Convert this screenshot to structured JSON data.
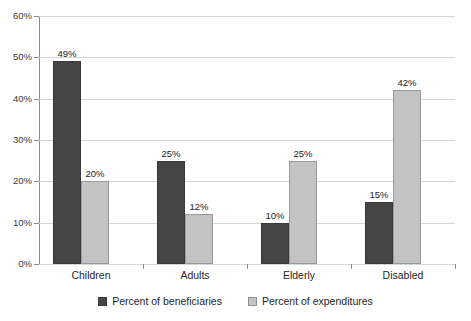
{
  "chart_data": {
    "type": "bar",
    "title": "",
    "subtitle": "",
    "xlabel": "",
    "ylabel": "",
    "categories": [
      "Children",
      "Adults",
      "Elderly",
      "Disabled"
    ],
    "series": [
      {
        "name": "Percent of beneficiaries",
        "color": "#454545",
        "values": [
          49,
          25,
          10,
          15
        ],
        "labels": [
          "49%",
          "25%",
          "10%",
          "15%"
        ]
      },
      {
        "name": "Percent of expenditures",
        "color": "#c3c3c3",
        "values": [
          20,
          12,
          25,
          42
        ],
        "labels": [
          "20%",
          "12%",
          "25%",
          "42%"
        ]
      }
    ],
    "ylim": [
      0,
      60
    ],
    "ytick_values": [
      0,
      10,
      20,
      30,
      40,
      50,
      60
    ],
    "ytick_labels": [
      "0%",
      "10%",
      "20%",
      "30%",
      "40%",
      "50%",
      "60%"
    ],
    "grid": true,
    "legend_position": "bottom",
    "annotations": []
  },
  "legend": {
    "items": [
      {
        "label": "Percent of beneficiaries"
      },
      {
        "label": "Percent of expenditures"
      }
    ]
  },
  "colors": {
    "series_0": "#454545",
    "series_1": "#c3c3c3",
    "gridline": "#d6d6d6",
    "axis": "#8c8c8c",
    "text": "#1f1f1f",
    "background": "#ffffff"
  }
}
